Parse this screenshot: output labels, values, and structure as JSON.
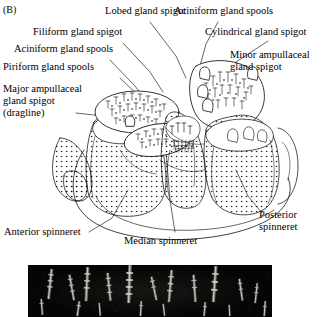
{
  "figure": {
    "panels": [
      {
        "tag": "(B)",
        "type": "line-drawing",
        "subject": "spider spinnerets with gland spigots"
      },
      {
        "tag": "(D)",
        "type": "electron-micrograph",
        "subject": "spigots and spools close-up"
      }
    ]
  },
  "panel_b": {
    "tag": "(B)",
    "labels": [
      {
        "id": "lobed",
        "text": "Lobed gland spigot"
      },
      {
        "id": "aciniform_top",
        "text": "Aciniform gland spools"
      },
      {
        "id": "filiform",
        "text": "Filiform gland spigot"
      },
      {
        "id": "cylindrical",
        "text": "Cylindrical gland spigot"
      },
      {
        "id": "aciniform_left",
        "text": "Aciniform gland spools"
      },
      {
        "id": "minor_amp_l1",
        "text": "Minor ampullaceal"
      },
      {
        "id": "minor_amp_l2",
        "text": "gland spigot"
      },
      {
        "id": "piriform",
        "text": "Piriform gland spools"
      },
      {
        "id": "major_amp_l1",
        "text": "Major ampullaceal"
      },
      {
        "id": "major_amp_l2",
        "text": "gland spigot"
      },
      {
        "id": "major_amp_l3",
        "text": "(dragline)"
      },
      {
        "id": "anterior",
        "text": "Anterior spinneret"
      },
      {
        "id": "median",
        "text": "Median spinneret"
      },
      {
        "id": "posterior_l1",
        "text": "Posterior"
      },
      {
        "id": "posterior_l2",
        "text": "spinneret"
      }
    ]
  },
  "panel_d": {
    "tag": "(D)"
  },
  "colors": {
    "ink": "#000000",
    "paper": "#ffffff",
    "micrograph_background": "#040404",
    "micrograph_highlight": "#d8d8d0",
    "stipple": "#7a7a7a"
  }
}
